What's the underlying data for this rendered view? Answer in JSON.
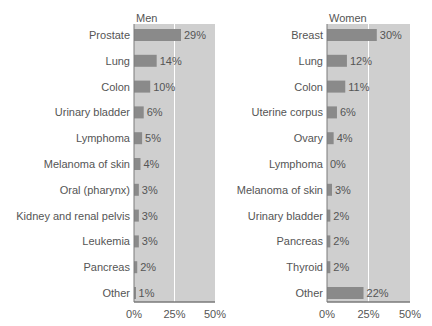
{
  "chart_data": [
    {
      "type": "bar",
      "orientation": "horizontal",
      "title": "Men",
      "categories": [
        "Prostate",
        "Lung",
        "Colon",
        "Urinary bladder",
        "Lymphoma",
        "Melanoma of skin",
        "Oral (pharynx)",
        "Kidney and renal pelvis",
        "Leukemia",
        "Pancreas",
        "Other"
      ],
      "values": [
        29,
        14,
        10,
        6,
        5,
        4,
        3,
        3,
        3,
        2,
        1
      ],
      "value_labels": [
        "29%",
        "14%",
        "10%",
        "6%",
        "5%",
        "4%",
        "3%",
        "3%",
        "3%",
        "2%",
        "1%"
      ],
      "xlabel": "",
      "ylabel": "",
      "xlim": [
        0,
        50
      ],
      "xticks": [
        0,
        25,
        50
      ],
      "xtick_labels": [
        "0%",
        "25%",
        "50%"
      ],
      "grid": true
    },
    {
      "type": "bar",
      "orientation": "horizontal",
      "title": "Women",
      "categories": [
        "Breast",
        "Lung",
        "Colon",
        "Uterine corpus",
        "Ovary",
        "Lymphoma",
        "Melanoma of skin",
        "Urinary bladder",
        "Pancreas",
        "Thyroid",
        "Other"
      ],
      "values": [
        30,
        12,
        11,
        6,
        4,
        0,
        3,
        2,
        2,
        2,
        22
      ],
      "value_labels": [
        "30%",
        "12%",
        "11%",
        "6%",
        "4%",
        "0%",
        "3%",
        "2%",
        "2%",
        "2%",
        "22%"
      ],
      "xlabel": "",
      "ylabel": "",
      "xlim": [
        0,
        50
      ],
      "xticks": [
        0,
        25,
        50
      ],
      "xtick_labels": [
        "0%",
        "25%",
        "50%"
      ],
      "grid": true
    }
  ],
  "colors": {
    "panel": "#cfcfcf",
    "bar": "#8a8a8a",
    "gridline": "#ffffff",
    "axis": "#7a7a7a",
    "text": "#555555"
  }
}
